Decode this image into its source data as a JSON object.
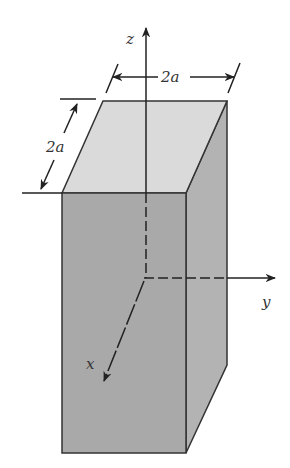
{
  "figure": {
    "type": "3d-rectangular-prism",
    "labels": {
      "z_axis": "z",
      "y_axis": "y",
      "x_axis": "x",
      "width_dim": "2a",
      "depth_dim": "2a"
    },
    "colors": {
      "top_face": "#d9d9d9",
      "front_face": "#a8a8a8",
      "side_face": "#b3b3b3",
      "lines": "#222222"
    }
  }
}
